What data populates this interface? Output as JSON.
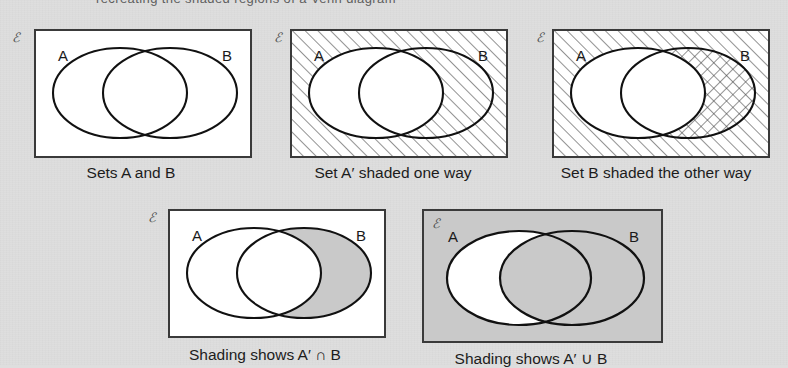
{
  "page": {
    "background_color": "#dedede",
    "ink_color": "#1a1a1a",
    "box_border_color": "#3a3a3a",
    "shade_color": "#c9c9c9",
    "top_cut_text": "recreating the shaded regions of a Venn diagram"
  },
  "universal_symbol": "ℰ",
  "diagrams": [
    {
      "id": "sets-a-and-b",
      "caption": "Sets A and B",
      "label_a": "A",
      "label_b": "B",
      "universe_fill": "none",
      "a_only_fill": "none",
      "intersection_fill": "none",
      "b_only_fill": "none",
      "description": "Two overlapping ellipses A and B inside a rectangular universal set, no shading"
    },
    {
      "id": "set-a-complement-hatched",
      "caption": "Set A′ shaded one way",
      "label_a": "A",
      "label_b": "B",
      "universe_fill": "hatch-right",
      "a_only_fill": "none",
      "intersection_fill": "none",
      "b_only_fill": "hatch-right",
      "description": "Everything outside ellipse A is hatched with up-right diagonal lines"
    },
    {
      "id": "set-b-hatched-other-way",
      "caption": "Set B shaded the other way",
      "label_a": "A",
      "label_b": "B",
      "universe_fill": "hatch-right",
      "a_only_fill": "none",
      "intersection_fill": "hatch-right",
      "b_only_fill": "cross-hatch",
      "description": "Universe hatched up-right; set B hatched the other way giving cross-hatch in B outside A"
    },
    {
      "id": "shading-shows-a-complement-intersect-b",
      "caption": "Shading shows A′ ∩ B",
      "label_a": "A",
      "label_b": "B",
      "universe_fill": "none",
      "a_only_fill": "none",
      "intersection_fill": "none",
      "b_only_fill": "grey",
      "description": "Only the part of B lying outside A is shaded grey"
    },
    {
      "id": "shading-shows-a-complement-union-b",
      "caption": "Shading shows A′ ∪ B",
      "label_a": "A",
      "label_b": "B",
      "universe_fill": "grey",
      "a_only_fill": "none",
      "intersection_fill": "grey",
      "b_only_fill": "grey",
      "description": "Everything shaded grey except the part of A lying outside B"
    }
  ]
}
